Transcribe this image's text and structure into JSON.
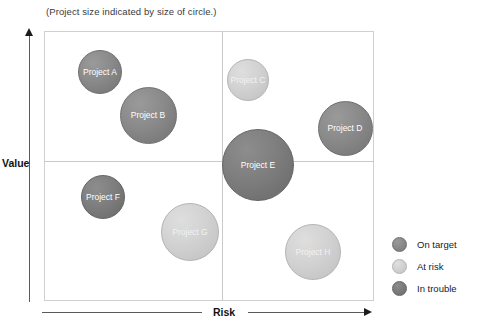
{
  "caption": "(Project size indicated by size of circle.)",
  "axes": {
    "x_label": "Risk",
    "y_label": "Value"
  },
  "legend": {
    "items": [
      {
        "label": "On target",
        "status": "on-target",
        "color": "#8b8b8b"
      },
      {
        "label": "At risk",
        "status": "at-risk",
        "color": "#d2d2d2"
      },
      {
        "label": "In trouble",
        "status": "in-trouble",
        "color": "#7c7c7c"
      }
    ]
  },
  "chart_data": {
    "type": "scatter",
    "title": "",
    "subtitle": "(Project size indicated by size of circle.)",
    "xlabel": "Risk",
    "ylabel": "Value",
    "xlim": [
      0,
      100
    ],
    "ylim": [
      0,
      100
    ],
    "grid": false,
    "legend_position": "right",
    "quadrant_lines": {
      "x": 54,
      "y": 48
    },
    "size_encodes": "project size",
    "points": [
      {
        "name": "Project A",
        "x": 17,
        "y": 84,
        "diameter_px": 44,
        "status": "on-target",
        "cx_px": 100,
        "cy_px": 72
      },
      {
        "name": "Project B",
        "x": 32,
        "y": 68,
        "diameter_px": 57,
        "status": "on-target",
        "cx_px": 148,
        "cy_px": 115
      },
      {
        "name": "Project C",
        "x": 62,
        "y": 81,
        "diameter_px": 42,
        "status": "at-risk",
        "cx_px": 248,
        "cy_px": 80
      },
      {
        "name": "Project D",
        "x": 91,
        "y": 63,
        "diameter_px": 55,
        "status": "on-target",
        "cx_px": 345,
        "cy_px": 128
      },
      {
        "name": "Project E",
        "x": 65,
        "y": 49,
        "diameter_px": 72,
        "status": "in-trouble",
        "cx_px": 258,
        "cy_px": 165
      },
      {
        "name": "Project F",
        "x": 18,
        "y": 38,
        "diameter_px": 44,
        "status": "in-trouble",
        "cx_px": 103,
        "cy_px": 197
      },
      {
        "name": "Project G",
        "x": 44,
        "y": 25,
        "diameter_px": 58,
        "status": "at-risk",
        "cx_px": 190,
        "cy_px": 232
      },
      {
        "name": "Project H",
        "x": 81,
        "y": 18,
        "diameter_px": 56,
        "status": "at-risk",
        "cx_px": 313,
        "cy_px": 252
      }
    ]
  }
}
